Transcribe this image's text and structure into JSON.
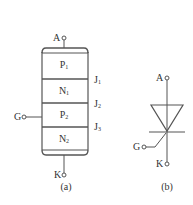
{
  "figure_a": {
    "caption": "(a)",
    "terminals": {
      "anode": "A",
      "gate": "G",
      "cathode": "K"
    },
    "layers": [
      {
        "main": "P",
        "sub": "1"
      },
      {
        "main": "N",
        "sub": "1"
      },
      {
        "main": "P",
        "sub": "2"
      },
      {
        "main": "N",
        "sub": "2"
      }
    ],
    "junctions": [
      {
        "main": "J",
        "sub": "1"
      },
      {
        "main": "J",
        "sub": "2"
      },
      {
        "main": "J",
        "sub": "3"
      }
    ]
  },
  "figure_b": {
    "caption": "(b)",
    "terminals": {
      "anode": "A",
      "gate": "G",
      "cathode": "K"
    },
    "symbol": "thyristor-scr"
  },
  "colors": {
    "line": "#555555",
    "text": "#333333",
    "background": "#ffffff"
  }
}
